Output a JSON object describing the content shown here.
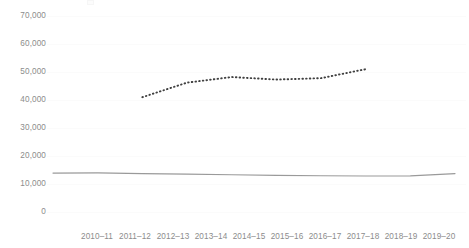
{
  "chart_data": {
    "type": "line",
    "title": "",
    "subtitle": "",
    "xlabel": "",
    "ylabel": "",
    "categories": [
      "2010–11",
      "2011–12",
      "2012–13",
      "2013–14",
      "2014–15",
      "2015–16",
      "2016–17",
      "2017–18",
      "2018–19",
      "2019–20"
    ],
    "ylim": [
      0,
      70000
    ],
    "y_ticks": [
      0,
      10000,
      20000,
      30000,
      40000,
      50000,
      60000,
      70000
    ],
    "y_tick_labels": [
      "0",
      "10,000",
      "20,000",
      "30,000",
      "40,000",
      "50,000",
      "60,000",
      "70,000"
    ],
    "grid": true,
    "legend": "none",
    "series": [
      {
        "name": "dotted-series",
        "style": "dotted",
        "color": "#404040",
        "values": [
          null,
          null,
          41000,
          46200,
          48200,
          47300,
          47800,
          51000,
          null,
          null
        ]
      },
      {
        "name": "solid-series",
        "style": "solid",
        "color": "#9a9a9a",
        "values": [
          13900,
          13950,
          13700,
          13500,
          13300,
          13100,
          12950,
          12850,
          12900,
          13700
        ]
      }
    ]
  },
  "axes": {
    "y_labels": [
      "70,000",
      "60,000",
      "50,000",
      "40,000",
      "30,000",
      "20,000",
      "10,000",
      "0"
    ],
    "x_labels": [
      "2010–11",
      "2011–12",
      "2012–13",
      "2013–14",
      "2014–15",
      "2015–16",
      "2016–17",
      "2017–18",
      "2018–19",
      "2019–20"
    ]
  },
  "colors": {
    "dotted_series": "#404040",
    "solid_series": "#9a9a9a",
    "tick_label": "#8c8c8c",
    "gridline": "#fbfbfb",
    "background": "#ffffff"
  }
}
